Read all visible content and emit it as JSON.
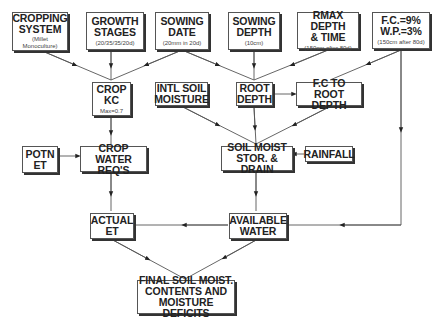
{
  "nodes": {
    "cropping_system": {
      "title1": "CROPPING",
      "title2": "SYSTEM",
      "sub1": "(Millet",
      "sub2": "Monoculture)"
    },
    "growth_stages": {
      "title1": "GROWTH",
      "title2": "STAGES",
      "sub1": "(20/35/35/20d)"
    },
    "sowing_date": {
      "title1": "SOWING",
      "title2": "DATE",
      "sub1": "(20mm in 20d)"
    },
    "sowing_depth": {
      "title1": "SOWING",
      "title2": "DEPTH",
      "sub1": "(10cm)"
    },
    "rmax_depth": {
      "title1": "RMAX DEPTH",
      "title2": "& TIME",
      "sub1": "(150cm after 80d)"
    },
    "fc_wp": {
      "title1": "F.C.=9%",
      "title2": "W.P.=3%",
      "sub1": "(150cm after 80d)"
    },
    "crop_kc": {
      "title1": "CROP",
      "title2": "KC",
      "sub1": "Max=0.7"
    },
    "intl_soil_moisture": {
      "title1": "INTL SOIL",
      "title2": "MOISTURE"
    },
    "root_depth": {
      "title1": "ROOT",
      "title2": "DEPTH"
    },
    "fc_to_root_depth": {
      "title1": "F.C TO",
      "title2": "ROOT DEPTH"
    },
    "potn_et": {
      "title1": "POTN",
      "title2": "ET"
    },
    "crop_water_reqs": {
      "title1": "CROP WATER",
      "title2": "REQ'S"
    },
    "soil_moist_stor": {
      "title1": "SOIL MOIST",
      "title2": "STOR. & DRAIN"
    },
    "rainfall": {
      "title1": "RAINFALL"
    },
    "actual_et": {
      "title1": "ACTUAL",
      "title2": "ET"
    },
    "available_water": {
      "title1": "AVAILABLE",
      "title2": "WATER"
    },
    "final_soil": {
      "title1": "FINAL SOIL MOIST.",
      "title2": "CONTENTS AND",
      "title3": "MOISTURE DEFICITS"
    }
  },
  "edges": [
    [
      "cropping_system",
      "crop_kc"
    ],
    [
      "growth_stages",
      "crop_kc"
    ],
    [
      "sowing_date",
      "crop_kc"
    ],
    [
      "sowing_date",
      "root_depth"
    ],
    [
      "sowing_depth",
      "root_depth"
    ],
    [
      "rmax_depth",
      "root_depth"
    ],
    [
      "fc_wp",
      "fc_to_root_depth"
    ],
    [
      "fc_wp",
      "available_water"
    ],
    [
      "root_depth",
      "fc_to_root_depth"
    ],
    [
      "crop_kc",
      "crop_water_reqs"
    ],
    [
      "potn_et",
      "crop_water_reqs"
    ],
    [
      "intl_soil_moisture",
      "soil_moist_stor"
    ],
    [
      "root_depth",
      "soil_moist_stor"
    ],
    [
      "fc_to_root_depth",
      "soil_moist_stor"
    ],
    [
      "rainfall",
      "soil_moist_stor"
    ],
    [
      "crop_water_reqs",
      "actual_et"
    ],
    [
      "soil_moist_stor",
      "available_water"
    ],
    [
      "available_water",
      "actual_et"
    ],
    [
      "actual_et",
      "final_soil"
    ],
    [
      "available_water",
      "final_soil"
    ]
  ]
}
